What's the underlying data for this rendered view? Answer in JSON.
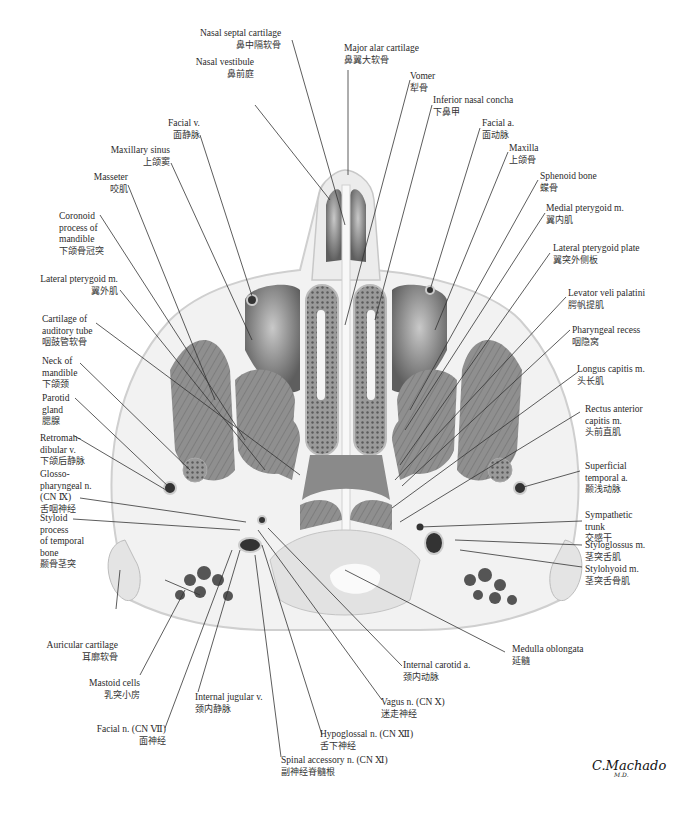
{
  "figure": {
    "signature": "C.Machado",
    "signature_suffix": "M.D."
  },
  "labels": {
    "nasal_septal_cartilage": {
      "en": "Nasal septal cartilage",
      "zh": "鼻中隔软骨"
    },
    "major_alar_cartilage": {
      "en": "Major alar cartilage",
      "zh": "鼻翼大软骨"
    },
    "vomer": {
      "en": "Vomer",
      "zh": "犁骨"
    },
    "nasal_vestibule": {
      "en": "Nasal vestibule",
      "zh": "鼻前庭"
    },
    "inferior_nasal_concha": {
      "en": "Inferior nasal concha",
      "zh": "下鼻甲"
    },
    "facial_v": {
      "en": "Facial v.",
      "zh": "面静脉"
    },
    "facial_a": {
      "en": "Facial a.",
      "zh": "面动脉"
    },
    "maxillary_sinus": {
      "en": "Maxillary sinus",
      "zh": "上颌窦"
    },
    "maxilla": {
      "en": "Maxilla",
      "zh": "上颌骨"
    },
    "masseter": {
      "en": "Masseter",
      "zh": "咬肌"
    },
    "sphenoid_bone": {
      "en": "Sphenoid bone",
      "zh": "蝶骨"
    },
    "coronoid_process": {
      "en1": "Coronoid",
      "en2": "process of",
      "en3": "mandible",
      "zh": "下颌骨冠突"
    },
    "medial_pterygoid": {
      "en": "Medial pterygoid m.",
      "zh": "翼内肌"
    },
    "lateral_pterygoid_m": {
      "en": "Lateral pterygoid m.",
      "zh": "翼外肌"
    },
    "lateral_pterygoid_plate": {
      "en": "Lateral pterygoid plate",
      "zh": "翼突外侧板"
    },
    "cartilage_auditory_tube": {
      "en1": "Cartilage of",
      "en2": "auditory tube",
      "zh": "咽鼓管软骨"
    },
    "levator_veli_palatini": {
      "en": "Levator veli palatini",
      "zh": "腭帆提肌"
    },
    "neck_of_mandible": {
      "en1": "Neck of",
      "en2": "mandible",
      "zh": "下颌颈"
    },
    "pharyngeal_recess": {
      "en": "Pharyngeal recess",
      "zh": "咽隐窝"
    },
    "parotid_gland": {
      "en1": "Parotid",
      "en2": "gland",
      "zh": "腮腺"
    },
    "longus_capitis": {
      "en": "Longus capitis m.",
      "zh": "头长肌"
    },
    "retromandibular_v": {
      "en1": "Retroman-",
      "en2": "dibular v.",
      "zh": "下颌后静脉"
    },
    "rectus_anterior_capitis": {
      "en1": "Rectus anterior",
      "en2": "capitis m.",
      "zh": "头前直肌"
    },
    "glossopharyngeal_n": {
      "en1": "Glosso-",
      "en2": "pharyngeal n.",
      "en3": "(CN Ⅸ)",
      "zh": "舌咽神经"
    },
    "superficial_temporal_a": {
      "en1": "Superficial",
      "en2": "temporal a.",
      "zh": "颞浅动脉"
    },
    "styloid_process": {
      "en1": "Styloid",
      "en2": "process",
      "en3": "of temporal",
      "en4": "bone",
      "zh": "颞骨茎突"
    },
    "sympathetic_trunk": {
      "en1": "Sympathetic",
      "en2": "trunk",
      "zh": "交感干"
    },
    "styloglossus": {
      "en": "Styloglossus m.",
      "zh": "茎突舌肌"
    },
    "stylohyoid": {
      "en": "Stylohyoid m.",
      "zh": "茎突舌骨肌"
    },
    "auricular_cartilage": {
      "en": "Auricular cartilage",
      "zh": "耳廓软骨"
    },
    "medulla_oblongata": {
      "en": "Medulla oblongata",
      "zh": "延髓"
    },
    "internal_carotid_a": {
      "en": "Internal carotid a.",
      "zh": "颈内动脉"
    },
    "mastoid_cells": {
      "en": "Mastoid cells",
      "zh": "乳突小房"
    },
    "internal_jugular_v": {
      "en": "Internal jugular v.",
      "zh": "颈内静脉"
    },
    "vagus_n": {
      "en": "Vagus n. (CN Ⅹ)",
      "zh": "迷走神经"
    },
    "facial_n": {
      "en": "Facial n. (CN Ⅶ)",
      "zh": "面神经"
    },
    "hypoglossal_n": {
      "en": "Hypoglossal n. (CN Ⅻ)",
      "zh": "舌下神经"
    },
    "spinal_accessory_n": {
      "en": "Spinal accessory n. (CN Ⅺ)",
      "zh": "副神经脊髓根"
    }
  },
  "colors": {
    "background": "#ffffff",
    "leader_line": "#333333",
    "muscle": "#8c8c8c",
    "bone": "#dcdcdc",
    "cavity": "#6e6e6e",
    "soft_tissue": "#efefef"
  }
}
